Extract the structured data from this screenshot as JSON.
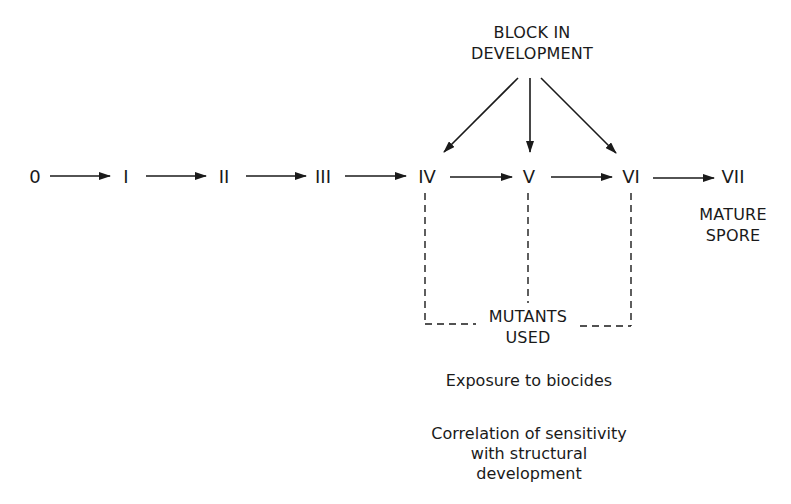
{
  "diagram": {
    "title_block": {
      "line1": "BLOCK IN",
      "line2": "DEVELOPMENT"
    },
    "stages": [
      {
        "label": "0",
        "x": 35
      },
      {
        "label": "I",
        "x": 125
      },
      {
        "label": "II",
        "x": 222
      },
      {
        "label": "III",
        "x": 322
      },
      {
        "label": "IV",
        "x": 426
      },
      {
        "label": "V",
        "x": 528
      },
      {
        "label": "VI",
        "x": 631
      },
      {
        "label": "VII",
        "x": 722
      }
    ],
    "mature_label": {
      "line1": "MATURE",
      "line2": "SPORE"
    },
    "mutants_label": {
      "line1": "MUTANTS",
      "line2": "USED"
    },
    "notes": {
      "exposure": "Exposure to biocides",
      "correlation_line1": "Correlation of sensitivity",
      "correlation_line2": "with structural",
      "correlation_line3": "development"
    },
    "colors": {
      "ink": "#1a1a1a",
      "background": "#ffffff"
    }
  }
}
